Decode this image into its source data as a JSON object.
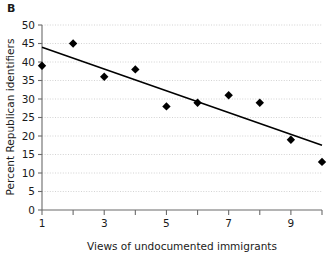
{
  "panel": {
    "label": "B"
  },
  "chart_data": {
    "type": "scatter",
    "title": "",
    "xlabel": "Views of undocumented immigrants",
    "ylabel": "Percent Republican identifiers",
    "x": [
      1,
      2,
      3,
      4,
      5,
      6,
      7,
      8,
      9,
      10
    ],
    "values": [
      39,
      45,
      36,
      38,
      28,
      29,
      31,
      29,
      19,
      13
    ],
    "series": [
      {
        "name": "Percent Republican identifiers",
        "values": [
          39,
          45,
          36,
          38,
          28,
          29,
          31,
          29,
          19,
          13
        ]
      }
    ],
    "xlim": [
      1,
      10
    ],
    "ylim": [
      0,
      50
    ],
    "xticks": [
      1,
      2,
      3,
      4,
      5,
      6,
      7,
      8,
      9,
      10
    ],
    "xtick_labels": [
      "1",
      "",
      "3",
      "",
      "5",
      "",
      "7",
      "",
      "9",
      ""
    ],
    "yticks": [
      0,
      5,
      10,
      15,
      20,
      25,
      30,
      35,
      40,
      45,
      50
    ],
    "ytick_labels": [
      "0",
      "5",
      "10",
      "15",
      "20",
      "25",
      "30",
      "35",
      "40",
      "45",
      "50"
    ],
    "grid": true,
    "grid_axis": "y",
    "legend": "none",
    "marker": "diamond",
    "marker_color": "#000000",
    "trendline": {
      "type": "linear",
      "x_start": 1,
      "y_start": 44,
      "x_end": 10,
      "y_end": 17.5,
      "color": "#000000"
    }
  }
}
